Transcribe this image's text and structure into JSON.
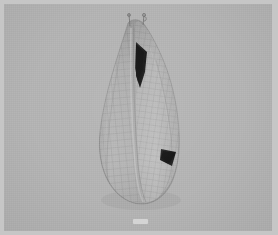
{
  "app": {
    "window_title": "",
    "frame_background_color": "#c6c6c6"
  },
  "viewport": {
    "name": "3d-viewport",
    "background_color": "#b3b3b3",
    "shading_mode": "solid-wireframe",
    "object_label": "",
    "overlay_text": ""
  },
  "cloth": {
    "name": "cloth-mesh",
    "description": "draped hanging cloth",
    "surface_color": "#a8a8a8",
    "surface_highlight_color": "#c4c4c4",
    "surface_shadow_color": "#8d8d8d",
    "wireframe_color": "#6e6e6e",
    "fold_shadow_color": "#1c1c1c",
    "grid_columns": 18,
    "grid_rows": 24,
    "pin_count": 2
  },
  "status": {
    "frame_indicator": "",
    "left_label": "",
    "left_sublabel": ""
  }
}
